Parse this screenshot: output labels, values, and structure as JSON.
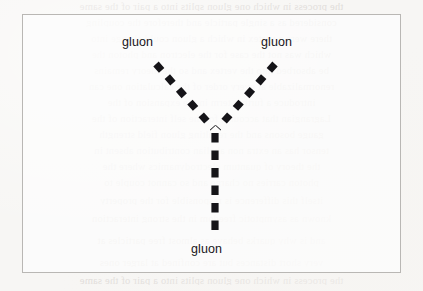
{
  "page": {
    "width": 423,
    "height": 291,
    "background_color": "#f7f6f4",
    "kind": "scanned-book-page"
  },
  "figure": {
    "frame": {
      "border_color": "#b9b7b4",
      "x": 22,
      "y": 14,
      "width": 379,
      "height": 259
    },
    "diagram_type": "feynman-diagram",
    "line_style": "dashed",
    "line_color": "#151418",
    "vertex": {
      "x": 215,
      "y": 130
    },
    "legs": [
      {
        "name": "gluon-leg-upper-left",
        "label": "gluon",
        "from": {
          "x": 156,
          "y": 64
        },
        "to": {
          "x": 213,
          "y": 128
        }
      },
      {
        "name": "gluon-leg-upper-right",
        "label": "gluon",
        "from": {
          "x": 275,
          "y": 64
        },
        "to": {
          "x": 218,
          "y": 128
        }
      },
      {
        "name": "gluon-leg-lower",
        "label": "gluon",
        "from": {
          "x": 215,
          "y": 133
        },
        "to": {
          "x": 215,
          "y": 234
        }
      }
    ],
    "labels": {
      "upper_left": "gluon",
      "upper_right": "gluon",
      "bottom": "gluon"
    }
  },
  "bleed_through": {
    "note": "faint mirrored show-through text from reverse of page",
    "color": "#ddd9d6",
    "lines": [
      "the process in which one gluon splits into a pair of the same",
      "considered as a single particle and therefore the coupling",
      "there were a vertex in which a gluon could change into",
      "which was not the case for the electron and photon the",
      "be absorbed into the vertex and so the theory remains",
      "renormalizable at every order of the calculation one can",
      "introduce a further term in the expansion of the",
      "Lagrangian that accounts for the self interaction of the",
      "gauge bosons and the resulting gluon field strength",
      "tensor has an extra non abelian contribution absent in",
      "the theory of quantum electrodynamics where the",
      "photon carries no charge and so cannot couple to",
      "itself this difference is responsible for the property",
      "known as asymptotic freedom in the strong interaction",
      "and is why quarks behave as almost free particles at",
      "very short distances but are confined at larger ones"
    ]
  }
}
